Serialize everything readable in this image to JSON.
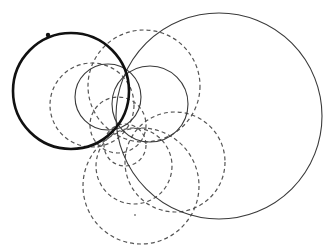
{
  "diagram": {
    "title": "",
    "width": 326,
    "height": 252,
    "background": "#ffffff",
    "common_points": [
      {
        "x": 128,
        "y": 70
      },
      {
        "x": 119,
        "y": 129
      }
    ],
    "thick_circle": {
      "cx": 71,
      "cy": 91,
      "r": 58,
      "color": "#111111"
    },
    "solid_circles": [
      {
        "cx": 219,
        "cy": 116,
        "r": 103
      },
      {
        "cx": 108,
        "cy": 97,
        "r": 33
      },
      {
        "cx": 150,
        "cy": 104,
        "r": 38
      }
    ],
    "dashed_circles": [
      {
        "cx": 92,
        "cy": 105,
        "r": 42
      },
      {
        "cx": 144,
        "cy": 86,
        "r": 56
      },
      {
        "cx": 118,
        "cy": 125,
        "r": 28
      },
      {
        "cx": 125,
        "cy": 145,
        "r": 21
      },
      {
        "cx": 175,
        "cy": 162,
        "r": 50
      },
      {
        "cx": 134,
        "cy": 166,
        "r": 38
      },
      {
        "cx": 141,
        "cy": 186,
        "r": 58
      }
    ],
    "marked_points": [
      {
        "x": 48,
        "y": 35,
        "kind": "dot"
      },
      {
        "x": 135,
        "y": 215,
        "kind": "speck"
      }
    ]
  }
}
